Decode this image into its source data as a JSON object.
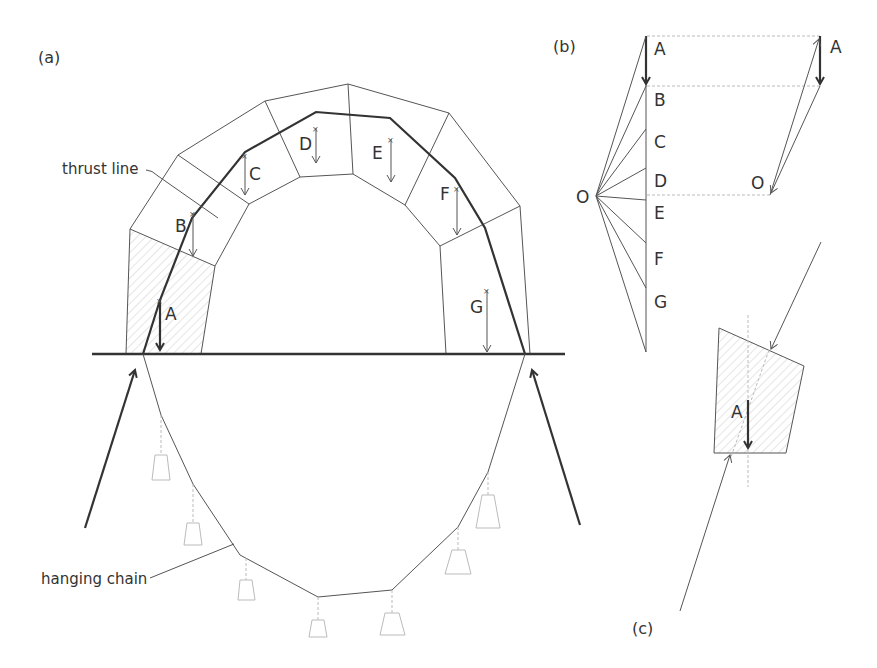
{
  "figure": {
    "panel_a": {
      "label": "(a)",
      "callouts": {
        "thrust_line": "thrust line",
        "hanging_chain": "hanging chain"
      },
      "voussoir_labels": [
        "A",
        "B",
        "C",
        "D",
        "E",
        "F",
        "G"
      ]
    },
    "panel_b": {
      "label": "(b)",
      "pole": "O",
      "load_labels": [
        "A",
        "B",
        "C",
        "D",
        "E",
        "F",
        "G"
      ],
      "small_polygon": {
        "load": "A",
        "pole": "O"
      }
    },
    "panel_c": {
      "label": "(c)",
      "block_label": "A"
    },
    "colors": {
      "line": "#333333",
      "thin": "#555555",
      "light": "#bbbbbb",
      "hatch": "#cccccc"
    }
  }
}
